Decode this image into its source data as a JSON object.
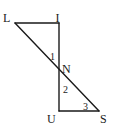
{
  "diagram": {
    "type": "geometry",
    "line_color": "#1a1a1a",
    "points": {
      "L": {
        "label": "L",
        "x": 15,
        "y": 23
      },
      "I": {
        "label": "I",
        "x": 59,
        "y": 23
      },
      "N": {
        "label": "N",
        "x": 59,
        "y": 69
      },
      "U": {
        "label": "U",
        "x": 59,
        "y": 111
      },
      "S": {
        "label": "S",
        "x": 99,
        "y": 111
      }
    },
    "segments": [
      "LI",
      "IU",
      "US",
      "LS"
    ],
    "angles": [
      {
        "label": "1",
        "at": "N",
        "between": "IN-LN"
      },
      {
        "label": "2",
        "at": "N",
        "between": "UN-SN"
      },
      {
        "label": "3",
        "at": "S",
        "between": "SU-SN"
      }
    ]
  }
}
